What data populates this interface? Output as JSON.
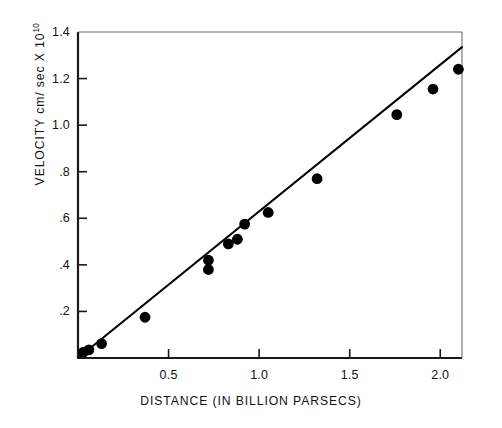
{
  "chart_data": {
    "type": "scatter",
    "title": "",
    "xlabel": "DISTANCE  (IN BILLION PARSECS)",
    "ylabel_text": "VELOCITY cm/ sec X 10",
    "ylabel_exponent": "10",
    "xlim": [
      0.0,
      2.12
    ],
    "ylim": [
      0.0,
      1.4
    ],
    "xticks": [
      0.5,
      1.0,
      1.5,
      2.0
    ],
    "xtick_labels": [
      "0.5",
      "1.0",
      "1.5",
      "2.0"
    ],
    "yticks": [
      0.2,
      0.4,
      0.6,
      0.8,
      1.0,
      1.2,
      1.4
    ],
    "ytick_labels": [
      ".2",
      ".4",
      ".6",
      ".8",
      "1.0",
      "1.2",
      "1.4"
    ],
    "grid": false,
    "legend": "none",
    "marker": "filled-circle",
    "marker_color": "#000000",
    "line_color": "#000000",
    "x": [
      0.03,
      0.06,
      0.13,
      0.37,
      0.72,
      0.72,
      0.83,
      0.88,
      0.92,
      1.05,
      1.32,
      1.76,
      1.96,
      2.1
    ],
    "y": [
      0.025,
      0.035,
      0.062,
      0.175,
      0.42,
      0.38,
      0.49,
      0.51,
      0.575,
      0.625,
      0.77,
      1.045,
      1.155,
      1.24
    ],
    "points": [
      {
        "x": 0.03,
        "y": 0.025
      },
      {
        "x": 0.06,
        "y": 0.035
      },
      {
        "x": 0.13,
        "y": 0.062
      },
      {
        "x": 0.37,
        "y": 0.175
      },
      {
        "x": 0.72,
        "y": 0.42
      },
      {
        "x": 0.72,
        "y": 0.38
      },
      {
        "x": 0.83,
        "y": 0.49
      },
      {
        "x": 0.88,
        "y": 0.51
      },
      {
        "x": 0.92,
        "y": 0.575
      },
      {
        "x": 1.05,
        "y": 0.625
      },
      {
        "x": 1.32,
        "y": 0.77
      },
      {
        "x": 1.76,
        "y": 1.045
      },
      {
        "x": 1.96,
        "y": 1.155
      },
      {
        "x": 2.1,
        "y": 1.24
      }
    ],
    "fit_line": {
      "x0": 0.0,
      "y0": 0.0,
      "x1": 2.12,
      "y1": 1.335
    }
  }
}
